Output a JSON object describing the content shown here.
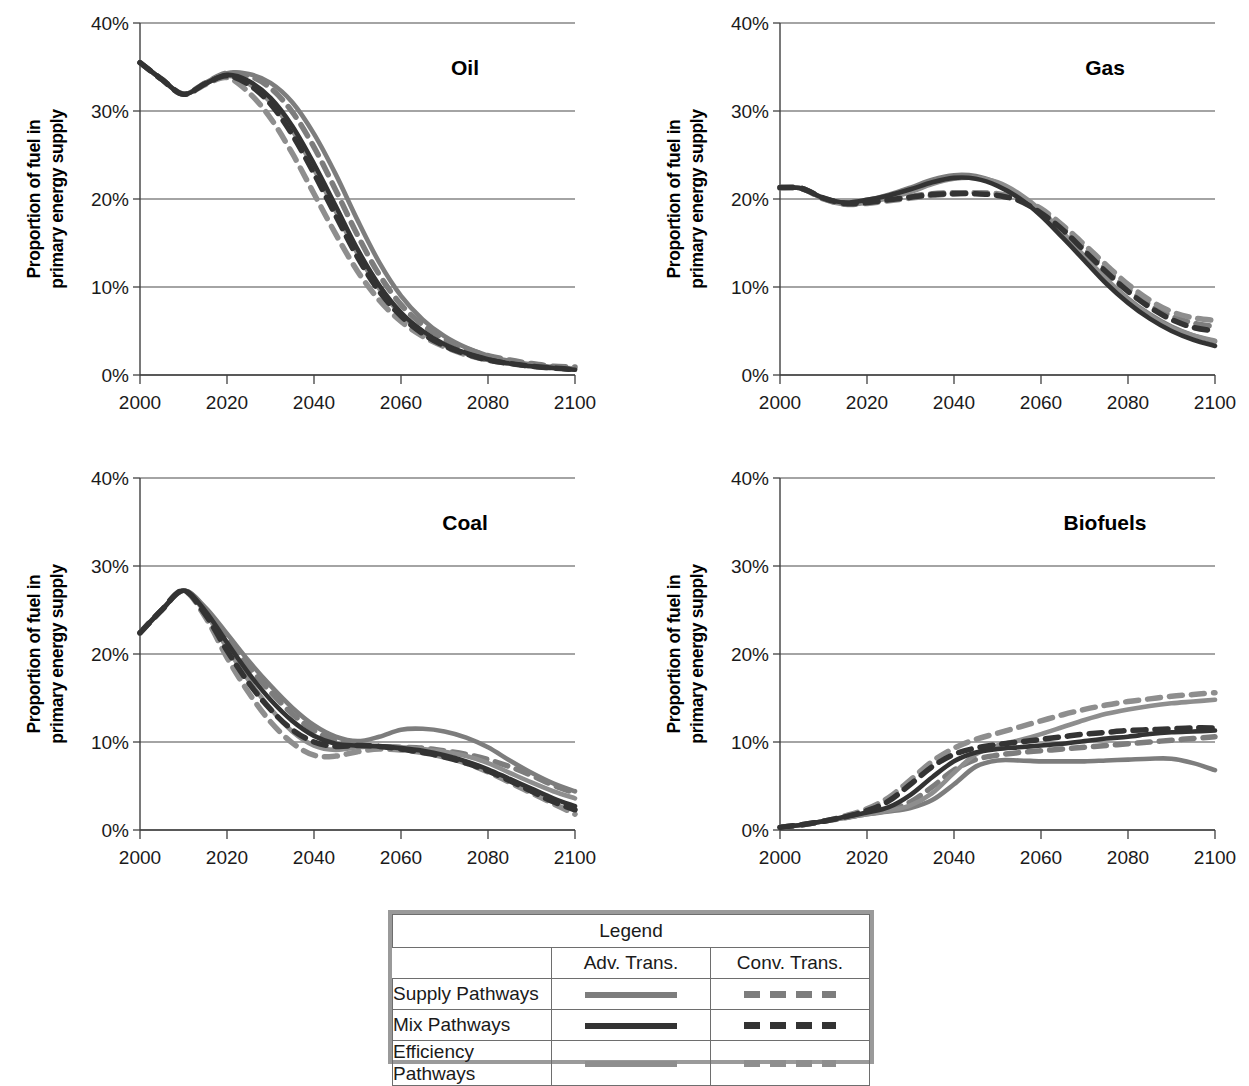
{
  "figure": {
    "y_axis_title": "Proportion of fuel in primary energy supply",
    "y_axis_title_line1": "Proportion of fuel in",
    "y_axis_title_line2": "primary energy supply",
    "y_ticks": [
      "0%",
      "10%",
      "20%",
      "30%",
      "40%"
    ],
    "x_ticks": [
      "2000",
      "2020",
      "2040",
      "2060",
      "2080",
      "2100"
    ]
  },
  "legend": {
    "title": "Legend",
    "columns": [
      "Adv. Trans.",
      "Conv. Trans."
    ],
    "rows": [
      "Supply Pathways",
      "Mix Pathways",
      "Efficiency Pathways"
    ]
  },
  "colors": {
    "supply": "#7d7d7d",
    "mix": "#333333",
    "efficiency": "#8e8e8e",
    "axis": "#404040",
    "grid": "#4a4a4a",
    "legend_border": "#9a9a9a",
    "text": "#1a1a1a"
  },
  "chart_data": [
    {
      "type": "line",
      "title": "Oil",
      "xlabel": "",
      "ylabel": "Proportion of fuel in primary energy supply",
      "xlim": [
        2000,
        2100
      ],
      "ylim": [
        0,
        40
      ],
      "grid": true,
      "legend_position": "external-bottom",
      "x": [
        2000,
        2005,
        2010,
        2015,
        2020,
        2025,
        2030,
        2035,
        2040,
        2045,
        2050,
        2055,
        2060,
        2065,
        2070,
        2075,
        2080,
        2085,
        2090,
        2095,
        2100
      ],
      "series": [
        {
          "name": "Supply Pathways / Adv. Trans.",
          "style": "solid",
          "color": "#7d7d7d",
          "values": [
            35.5,
            33.6,
            31.9,
            33.2,
            34.3,
            34.2,
            33.2,
            31.0,
            27.4,
            22.8,
            17.6,
            12.8,
            9.0,
            6.3,
            4.4,
            3.1,
            2.2,
            1.6,
            1.2,
            0.9,
            0.7
          ]
        },
        {
          "name": "Supply Pathways / Conv. Trans.",
          "style": "dashed",
          "color": "#7d7d7d",
          "values": [
            35.5,
            33.6,
            31.9,
            33.2,
            34.3,
            34.0,
            32.6,
            29.9,
            25.9,
            21.0,
            15.9,
            11.4,
            8.0,
            5.7,
            4.1,
            3.0,
            2.2,
            1.7,
            1.3,
            1.0,
            0.9
          ]
        },
        {
          "name": "Mix Pathways / Adv. Trans.",
          "style": "solid",
          "color": "#333333",
          "values": [
            35.5,
            33.6,
            31.9,
            33.1,
            34.1,
            33.4,
            31.5,
            28.3,
            24.0,
            19.2,
            14.3,
            10.2,
            7.1,
            5.0,
            3.5,
            2.5,
            1.8,
            1.3,
            1.0,
            0.8,
            0.6
          ]
        },
        {
          "name": "Mix Pathways / Conv. Trans.",
          "style": "dashed",
          "color": "#333333",
          "values": [
            35.5,
            33.6,
            31.9,
            33.1,
            34.0,
            33.0,
            30.8,
            27.3,
            22.9,
            18.1,
            13.4,
            9.5,
            6.7,
            4.7,
            3.3,
            2.4,
            1.7,
            1.3,
            1.0,
            0.8,
            0.6
          ]
        },
        {
          "name": "Efficiency Pathways / Adv. Trans.",
          "style": "solid",
          "color": "#8e8e8e",
          "values": [
            35.5,
            33.6,
            31.9,
            33.1,
            34.0,
            33.1,
            31.0,
            27.8,
            23.4,
            18.6,
            13.8,
            9.8,
            6.9,
            4.8,
            3.4,
            2.4,
            1.7,
            1.3,
            1.0,
            0.8,
            0.6
          ]
        },
        {
          "name": "Efficiency Pathways / Conv. Trans.",
          "style": "dashed",
          "color": "#8e8e8e",
          "values": [
            35.5,
            33.6,
            31.9,
            33.0,
            33.8,
            32.1,
            29.2,
            25.2,
            20.6,
            16.0,
            11.8,
            8.5,
            6.1,
            4.4,
            3.2,
            2.3,
            1.7,
            1.3,
            1.0,
            0.8,
            0.7
          ]
        }
      ]
    },
    {
      "type": "line",
      "title": "Gas",
      "xlabel": "",
      "ylabel": "Proportion of fuel in primary energy supply",
      "xlim": [
        2000,
        2100
      ],
      "ylim": [
        0,
        40
      ],
      "grid": true,
      "legend_position": "external-bottom",
      "x": [
        2000,
        2005,
        2010,
        2015,
        2020,
        2025,
        2030,
        2035,
        2040,
        2045,
        2050,
        2055,
        2060,
        2065,
        2070,
        2075,
        2080,
        2085,
        2090,
        2095,
        2100
      ],
      "series": [
        {
          "name": "Supply Pathways / Adv. Trans.",
          "style": "solid",
          "color": "#7d7d7d",
          "values": [
            21.3,
            21.2,
            20.1,
            19.6,
            19.9,
            20.5,
            21.3,
            22.2,
            22.7,
            22.6,
            21.8,
            20.4,
            18.4,
            16.0,
            13.4,
            10.9,
            8.7,
            6.9,
            5.5,
            4.5,
            3.8
          ]
        },
        {
          "name": "Supply Pathways / Conv. Trans.",
          "style": "dashed",
          "color": "#7d7d7d",
          "values": [
            21.3,
            21.2,
            20.1,
            19.5,
            19.6,
            19.9,
            20.3,
            20.6,
            20.7,
            20.7,
            20.5,
            19.9,
            18.6,
            16.7,
            14.4,
            12.0,
            9.8,
            8.0,
            6.7,
            5.9,
            5.5
          ]
        },
        {
          "name": "Mix Pathways / Adv. Trans.",
          "style": "solid",
          "color": "#333333",
          "values": [
            21.3,
            21.2,
            20.1,
            19.6,
            19.9,
            20.4,
            21.1,
            21.9,
            22.4,
            22.3,
            21.5,
            20.1,
            18.1,
            15.6,
            13.0,
            10.4,
            8.2,
            6.4,
            5.0,
            4.0,
            3.3
          ]
        },
        {
          "name": "Mix Pathways / Conv. Trans.",
          "style": "dashed",
          "color": "#333333",
          "values": [
            21.3,
            21.2,
            20.1,
            19.5,
            19.6,
            19.9,
            20.2,
            20.5,
            20.6,
            20.6,
            20.4,
            19.8,
            18.4,
            16.5,
            14.1,
            11.7,
            9.5,
            7.7,
            6.3,
            5.4,
            5.0
          ]
        },
        {
          "name": "Efficiency Pathways / Adv. Trans.",
          "style": "solid",
          "color": "#8e8e8e",
          "values": [
            21.3,
            21.2,
            20.0,
            19.4,
            19.6,
            20.1,
            20.8,
            21.7,
            22.3,
            22.4,
            21.9,
            20.6,
            18.7,
            16.2,
            13.5,
            10.9,
            8.6,
            6.8,
            5.4,
            4.5,
            3.9
          ]
        },
        {
          "name": "Efficiency Pathways / Conv. Trans.",
          "style": "dashed",
          "color": "#8e8e8e",
          "values": [
            21.3,
            21.2,
            20.0,
            19.4,
            19.5,
            19.8,
            20.1,
            20.4,
            20.6,
            20.7,
            20.6,
            20.1,
            18.9,
            17.0,
            14.8,
            12.5,
            10.3,
            8.5,
            7.2,
            6.5,
            6.2
          ]
        }
      ]
    },
    {
      "type": "line",
      "title": "Coal",
      "xlabel": "",
      "ylabel": "Proportion of fuel in primary energy supply",
      "xlim": [
        2000,
        2100
      ],
      "ylim": [
        0,
        40
      ],
      "grid": true,
      "legend_position": "external-bottom",
      "x": [
        2000,
        2005,
        2010,
        2015,
        2020,
        2025,
        2030,
        2035,
        2040,
        2045,
        2050,
        2055,
        2060,
        2065,
        2070,
        2075,
        2080,
        2085,
        2090,
        2095,
        2100
      ],
      "series": [
        {
          "name": "Supply Pathways / Adv. Trans.",
          "style": "solid",
          "color": "#7d7d7d",
          "values": [
            22.4,
            25.0,
            27.2,
            25.3,
            22.3,
            19.2,
            16.4,
            13.9,
            11.9,
            10.6,
            10.1,
            10.6,
            11.4,
            11.5,
            11.2,
            10.5,
            9.4,
            7.9,
            6.5,
            5.3,
            4.4
          ]
        },
        {
          "name": "Supply Pathways / Conv. Trans.",
          "style": "dashed",
          "color": "#7d7d7d",
          "values": [
            22.4,
            25.0,
            27.2,
            25.1,
            21.8,
            18.6,
            15.7,
            13.2,
            11.3,
            10.1,
            9.6,
            9.5,
            9.4,
            9.3,
            9.0,
            8.6,
            8.0,
            7.2,
            6.2,
            5.1,
            4.2
          ]
        },
        {
          "name": "Mix Pathways / Adv. Trans.",
          "style": "solid",
          "color": "#333333",
          "values": [
            22.4,
            25.0,
            27.2,
            24.9,
            21.3,
            17.8,
            14.8,
            12.4,
            10.7,
            9.8,
            9.6,
            9.5,
            9.3,
            9.0,
            8.5,
            7.8,
            6.9,
            5.8,
            4.7,
            3.6,
            2.7
          ]
        },
        {
          "name": "Mix Pathways / Conv. Trans.",
          "style": "dashed",
          "color": "#333333",
          "values": [
            22.4,
            25.0,
            27.2,
            24.5,
            20.4,
            16.7,
            13.7,
            11.4,
            10.0,
            9.5,
            9.6,
            9.5,
            9.2,
            8.8,
            8.3,
            7.6,
            6.7,
            5.6,
            4.4,
            3.2,
            2.3
          ]
        },
        {
          "name": "Efficiency Pathways / Adv. Trans.",
          "style": "solid",
          "color": "#8e8e8e",
          "values": [
            22.4,
            25.0,
            27.2,
            24.7,
            20.7,
            17.0,
            13.8,
            11.2,
            9.6,
            9.1,
            9.4,
            9.5,
            9.4,
            9.2,
            8.9,
            8.4,
            7.6,
            6.5,
            5.4,
            4.4,
            3.6
          ]
        },
        {
          "name": "Efficiency Pathways / Conv. Trans.",
          "style": "dashed",
          "color": "#8e8e8e",
          "values": [
            22.4,
            25.0,
            27.2,
            24.2,
            19.6,
            15.6,
            12.3,
            9.9,
            8.5,
            8.4,
            8.9,
            9.2,
            9.1,
            8.8,
            8.3,
            7.6,
            6.6,
            5.4,
            4.2,
            3.0,
            1.8
          ]
        }
      ]
    },
    {
      "type": "line",
      "title": "Biofuels",
      "xlabel": "",
      "ylabel": "Proportion of fuel in primary energy supply",
      "xlim": [
        2000,
        2100
      ],
      "ylim": [
        0,
        40
      ],
      "grid": true,
      "legend_position": "external-bottom",
      "x": [
        2000,
        2005,
        2010,
        2015,
        2020,
        2025,
        2030,
        2035,
        2040,
        2045,
        2050,
        2055,
        2060,
        2065,
        2070,
        2075,
        2080,
        2085,
        2090,
        2095,
        2100
      ],
      "series": [
        {
          "name": "Supply Pathways / Adv. Trans.",
          "style": "solid",
          "color": "#7d7d7d",
          "values": [
            0.3,
            0.6,
            1.0,
            1.4,
            1.8,
            2.1,
            2.5,
            3.4,
            5.2,
            7.2,
            7.9,
            7.9,
            7.8,
            7.8,
            7.8,
            7.9,
            8.0,
            8.1,
            8.1,
            7.6,
            6.8
          ]
        },
        {
          "name": "Supply Pathways / Conv. Trans.",
          "style": "dashed",
          "color": "#7d7d7d",
          "values": [
            0.3,
            0.6,
            1.0,
            1.4,
            1.9,
            2.3,
            3.2,
            4.9,
            6.8,
            8.0,
            8.5,
            8.8,
            9.0,
            9.2,
            9.4,
            9.6,
            9.8,
            10.0,
            10.2,
            10.4,
            10.6
          ]
        },
        {
          "name": "Mix Pathways / Adv. Trans.",
          "style": "solid",
          "color": "#333333",
          "values": [
            0.3,
            0.6,
            1.0,
            1.5,
            2.0,
            2.6,
            4.0,
            6.0,
            7.8,
            8.8,
            9.2,
            9.4,
            9.6,
            9.8,
            10.1,
            10.4,
            10.6,
            10.9,
            11.1,
            11.2,
            11.3
          ]
        },
        {
          "name": "Mix Pathways / Conv. Trans.",
          "style": "dashed",
          "color": "#333333",
          "values": [
            0.3,
            0.6,
            1.0,
            1.5,
            2.2,
            3.3,
            5.2,
            7.2,
            8.6,
            9.3,
            9.7,
            10.0,
            10.3,
            10.6,
            10.9,
            11.1,
            11.3,
            11.4,
            11.5,
            11.6,
            11.6
          ]
        },
        {
          "name": "Efficiency Pathways / Adv. Trans.",
          "style": "solid",
          "color": "#8e8e8e",
          "values": [
            0.3,
            0.6,
            1.0,
            1.4,
            1.8,
            2.2,
            2.8,
            4.2,
            6.5,
            8.6,
            9.6,
            10.2,
            10.9,
            11.7,
            12.5,
            13.2,
            13.7,
            14.1,
            14.4,
            14.6,
            14.8
          ]
        },
        {
          "name": "Efficiency Pathways / Conv. Trans.",
          "style": "dashed",
          "color": "#8e8e8e",
          "values": [
            0.3,
            0.6,
            1.0,
            1.6,
            2.4,
            3.7,
            5.7,
            7.8,
            9.3,
            10.3,
            11.0,
            11.7,
            12.4,
            13.1,
            13.7,
            14.2,
            14.6,
            14.9,
            15.2,
            15.4,
            15.6
          ]
        }
      ]
    }
  ]
}
